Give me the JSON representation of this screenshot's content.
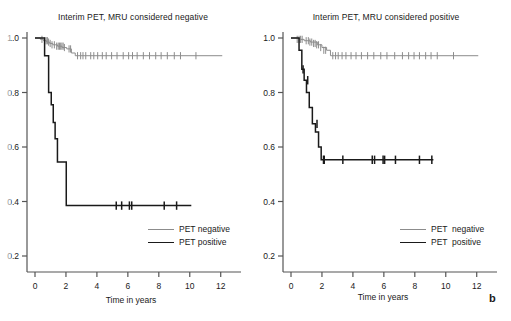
{
  "figure": {
    "panel_letter": "b",
    "background": "#ffffff",
    "axis_color": "#555555",
    "colors": {
      "pet_negative": "#8c8c8c",
      "pet_positive": "#1a1a1a",
      "axis": "#555555",
      "text": "#1a1a1a"
    }
  },
  "panels": [
    {
      "id": "left",
      "title": "Interim PET, MRU considered negative",
      "xlabel": "Time in years",
      "ylabel": "",
      "ytick_labels": [
        "1.0",
        "0.8",
        "0.6",
        "0.4",
        "0.2"
      ],
      "xtick_labels": [
        "0",
        "2",
        "4",
        "6",
        "8",
        "10",
        "12"
      ],
      "legend": [
        {
          "label": "PET negative",
          "series": "pet_negative"
        },
        {
          "label": "PET positive",
          "series": "pet_positive"
        }
      ]
    },
    {
      "id": "right",
      "title": "Interim PET, MRU considered positive",
      "xlabel": "Time in years",
      "ylabel": "",
      "ytick_labels": [
        "1.0",
        "0.8",
        "0.6",
        "0.4",
        "0.2"
      ],
      "xtick_labels": [
        "0",
        "2",
        "4",
        "6",
        "8",
        "10",
        "12"
      ],
      "legend": [
        {
          "label": "PET  negative",
          "series": "pet_negative"
        },
        {
          "label": "PET  positive",
          "series": "pet_positive"
        }
      ]
    }
  ],
  "chart_data": [
    {
      "type": "line",
      "chart_id": "interim-pet-mru-negative",
      "title": "Interim PET, MRU considered negative",
      "xlabel": "Time in years",
      "ylabel": "",
      "xlim": [
        0,
        12.6
      ],
      "ylim": [
        0.13,
        1.03
      ],
      "xticks": [
        0,
        2,
        4,
        6,
        8,
        10,
        12
      ],
      "yticks": [
        1.0,
        0.8,
        0.6,
        0.4,
        0.2
      ],
      "grid": false,
      "legend_position": "lower-right",
      "series": [
        {
          "name": "PET negative",
          "color": "#8c8c8c",
          "style": "step-post",
          "x": [
            0.0,
            0.35,
            0.55,
            0.75,
            0.95,
            1.15,
            1.45,
            1.75,
            2.05,
            2.35,
            2.6,
            12.1
          ],
          "y": [
            1.0,
            0.995,
            0.99,
            0.985,
            0.98,
            0.975,
            0.97,
            0.965,
            0.96,
            0.945,
            0.935,
            0.935
          ],
          "censor_x": [
            0.45,
            0.62,
            0.72,
            0.8,
            0.88,
            0.98,
            1.1,
            1.25,
            1.4,
            1.5,
            1.58,
            1.66,
            1.74,
            1.82,
            1.9,
            2.2,
            2.3,
            2.75,
            2.95,
            3.1,
            3.28,
            3.6,
            3.8,
            4.05,
            4.35,
            4.6,
            4.95,
            5.3,
            5.7,
            6.05,
            6.3,
            6.6,
            7.0,
            7.4,
            7.8,
            8.15,
            8.55,
            9.0,
            9.4,
            10.4
          ],
          "censor_y": [
            0.995,
            0.99,
            0.99,
            0.99,
            0.985,
            0.98,
            0.975,
            0.975,
            0.97,
            0.97,
            0.97,
            0.97,
            0.97,
            0.97,
            0.965,
            0.96,
            0.96,
            0.935,
            0.935,
            0.935,
            0.935,
            0.935,
            0.935,
            0.935,
            0.935,
            0.935,
            0.935,
            0.935,
            0.935,
            0.935,
            0.935,
            0.935,
            0.935,
            0.935,
            0.935,
            0.935,
            0.935,
            0.935,
            0.935,
            0.935
          ]
        },
        {
          "name": "PET positive",
          "color": "#1a1a1a",
          "style": "step-post",
          "x": [
            0.0,
            0.62,
            0.62,
            0.88,
            0.88,
            1.05,
            1.05,
            1.18,
            1.18,
            1.3,
            1.3,
            1.45,
            1.45,
            1.62,
            1.62,
            2.02,
            2.02,
            10.1
          ],
          "y": [
            1.0,
            1.0,
            0.935,
            0.935,
            0.8,
            0.8,
            0.755,
            0.755,
            0.69,
            0.69,
            0.63,
            0.63,
            0.545,
            0.545,
            0.545,
            0.545,
            0.385,
            0.385
          ],
          "censor_x": [
            5.25,
            5.6,
            6.1,
            6.25,
            8.35,
            9.15
          ],
          "censor_y": [
            0.385,
            0.385,
            0.385,
            0.385,
            0.385,
            0.385
          ]
        }
      ]
    },
    {
      "type": "line",
      "chart_id": "interim-pet-mru-positive",
      "title": "Interim PET, MRU considered positive",
      "xlabel": "Time in years",
      "ylabel": "",
      "xlim": [
        0,
        12.6
      ],
      "ylim": [
        0.13,
        1.03
      ],
      "xticks": [
        0,
        2,
        4,
        6,
        8,
        10,
        12
      ],
      "yticks": [
        1.0,
        0.8,
        0.6,
        0.4,
        0.2
      ],
      "grid": false,
      "legend_position": "lower-right",
      "series": [
        {
          "name": "PET  negative",
          "color": "#8c8c8c",
          "style": "step-post",
          "x": [
            0.0,
            0.55,
            0.85,
            1.25,
            1.7,
            2.0,
            2.3,
            2.55,
            12.1
          ],
          "y": [
            1.0,
            0.995,
            0.99,
            0.985,
            0.975,
            0.965,
            0.955,
            0.935,
            0.935
          ],
          "censor_x": [
            0.4,
            0.52,
            0.62,
            0.72,
            0.98,
            1.12,
            1.22,
            1.34,
            1.46,
            1.56,
            1.66,
            1.78,
            1.92,
            2.12,
            2.24,
            2.7,
            2.88,
            3.05,
            3.3,
            3.55,
            3.88,
            4.2,
            4.55,
            4.95,
            5.35,
            5.8,
            6.2,
            6.7,
            7.2,
            7.6,
            7.95,
            8.3,
            8.7,
            9.05,
            9.45,
            10.5
          ],
          "censor_y": [
            0.995,
            0.995,
            0.995,
            0.995,
            0.99,
            0.99,
            0.985,
            0.985,
            0.98,
            0.98,
            0.975,
            0.975,
            0.965,
            0.955,
            0.955,
            0.935,
            0.935,
            0.935,
            0.935,
            0.935,
            0.935,
            0.935,
            0.935,
            0.935,
            0.935,
            0.935,
            0.935,
            0.935,
            0.935,
            0.935,
            0.935,
            0.935,
            0.935,
            0.935,
            0.935,
            0.935
          ]
        },
        {
          "name": "PET  positive",
          "color": "#1a1a1a",
          "style": "step-post",
          "x": [
            0.0,
            0.52,
            0.52,
            0.7,
            0.7,
            0.85,
            0.85,
            1.0,
            1.0,
            1.18,
            1.18,
            1.38,
            1.38,
            1.58,
            1.58,
            1.78,
            1.78,
            1.95,
            1.95,
            9.2
          ],
          "y": [
            1.0,
            1.0,
            0.955,
            0.955,
            0.885,
            0.885,
            0.845,
            0.845,
            0.8,
            0.8,
            0.745,
            0.745,
            0.685,
            0.685,
            0.655,
            0.655,
            0.6,
            0.6,
            0.553,
            0.553
          ],
          "censor_x": [
            0.78,
            1.08,
            1.68,
            2.1,
            2.15,
            3.35,
            5.25,
            5.4,
            5.95,
            6.05,
            6.75,
            8.3,
            9.1
          ],
          "censor_y": [
            0.885,
            0.845,
            0.685,
            0.553,
            0.553,
            0.553,
            0.553,
            0.553,
            0.553,
            0.553,
            0.553,
            0.553,
            0.553
          ]
        }
      ]
    }
  ]
}
